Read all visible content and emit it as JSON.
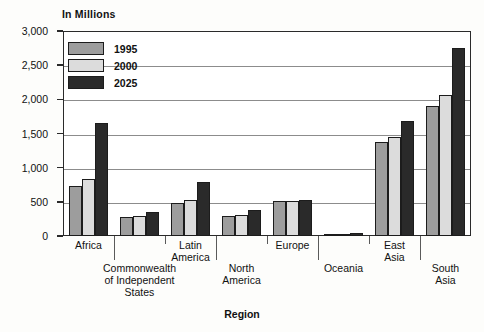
{
  "chart_data": {
    "type": "bar",
    "title": "",
    "ylabel": "In Millions",
    "xlabel": "Region",
    "ylim": [
      0,
      3000
    ],
    "yticks": [
      0,
      500,
      1000,
      1500,
      2000,
      2500,
      3000
    ],
    "ytick_labels": [
      "0",
      "500",
      "1,000",
      "1,500",
      "2,000",
      "2,500",
      "3,000"
    ],
    "grid": true,
    "legend_position": "top-left",
    "categories": [
      "Africa",
      "Commonwealth\nof Independent\nStates",
      "Latin\nAmerica",
      "North\nAmerica",
      "Europe",
      "Oceania",
      "East\nAsia",
      "South\nAsia"
    ],
    "series": [
      {
        "name": "1995",
        "color": "#9d9d9d",
        "values": [
          730,
          285,
          480,
          290,
          510,
          30,
          1380,
          1900
        ]
      },
      {
        "name": "2000",
        "color": "#dcdcdc",
        "values": [
          830,
          300,
          520,
          310,
          515,
          32,
          1450,
          2060
        ]
      },
      {
        "name": "2025",
        "color": "#2a2a2a",
        "values": [
          1650,
          350,
          790,
          380,
          520,
          42,
          1680,
          2750
        ]
      }
    ]
  },
  "legend": {
    "items": [
      {
        "label": "1995"
      },
      {
        "label": "2000"
      },
      {
        "label": "2025"
      }
    ]
  },
  "axes": {
    "y_title": "In Millions",
    "x_title": "Region"
  }
}
